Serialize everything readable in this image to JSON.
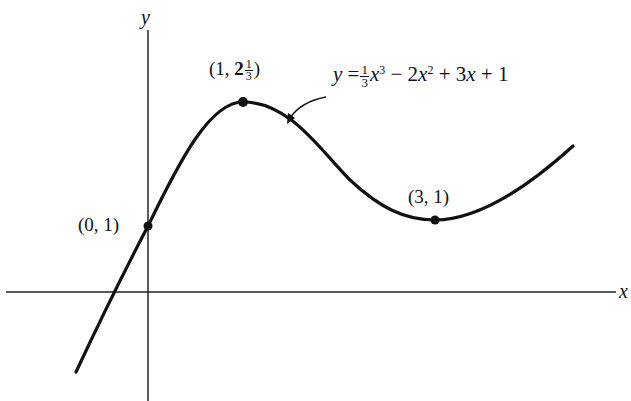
{
  "figure": {
    "function_label": {
      "lhs": "y",
      "eq": "=",
      "frac_num": "1",
      "frac_den": "3",
      "term1_var": "x",
      "term1_exp": "3",
      "op1": "−",
      "term2_coef": "2",
      "term2_var": "x",
      "term2_exp": "2",
      "op2": "+",
      "term3_coef": "3",
      "term3_var": "x",
      "op3": "+",
      "constant": "1"
    },
    "axes": {
      "x_label": "x",
      "y_label": "y"
    },
    "points": [
      {
        "id": "y-intercept",
        "label": "(0, 1)",
        "x": 0,
        "y": 1
      },
      {
        "id": "local-max",
        "label_open": "(1, ",
        "label_whole": "2",
        "label_num": "1",
        "label_den": "3",
        "label_close": ")",
        "x": 1,
        "y": 2.3333
      },
      {
        "id": "local-min",
        "label": "(3, 1)",
        "x": 3,
        "y": 1
      }
    ],
    "colors": {
      "ink": "#111111",
      "background": "#ffffff"
    }
  }
}
